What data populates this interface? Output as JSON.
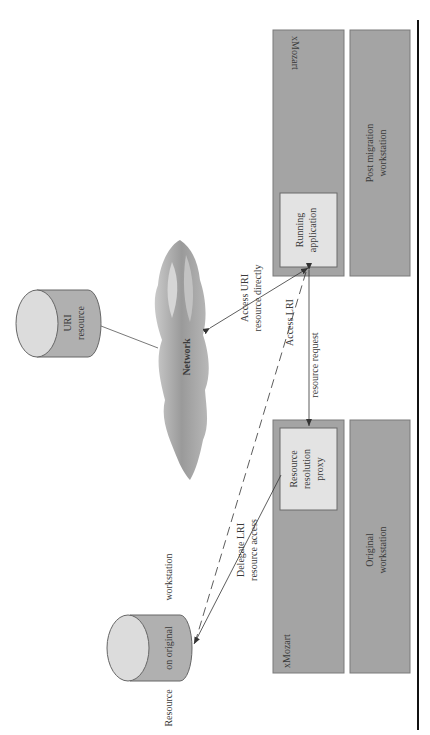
{
  "diagram": {
    "orientation": "rotated-90-counterclockwise",
    "colors": {
      "box_fill": "#a4a4a4",
      "box_stroke": "#7a7a7a",
      "inner_fill": "#e3e3e3",
      "cylinder_body": "#b0b0b0",
      "cylinder_top": "#dcdcdc",
      "cloud": "#a8a8a8",
      "line": "#444444",
      "rule": "#111111"
    },
    "nodes": {
      "top_xmozart": {
        "label": "xMozart"
      },
      "running_app": {
        "line1": "Running",
        "line2": "application"
      },
      "post_migration": {
        "line1": "Post migration",
        "line2": "workstation"
      },
      "bottom_xmozart": {
        "label": "xMozart"
      },
      "proxy": {
        "line1": "Resource",
        "line2": "resolution",
        "line3": "proxy"
      },
      "original_ws": {
        "line1": "Original",
        "line2": "workstation"
      },
      "uri_resource": {
        "line1": "URI",
        "line2": "resource"
      },
      "network": {
        "label": "Network"
      },
      "orig_resource": {
        "part1": "Resource",
        "part2": "on original",
        "part3": "workstation"
      }
    },
    "edges": {
      "access_uri": {
        "line1": "Access URI",
        "line2": "resource directly"
      },
      "access_lri": {
        "line1": "Access LRI",
        "line2": "resource request"
      },
      "delegate_lri": {
        "line1": "Delegate LRI",
        "line2": "resource access"
      }
    }
  }
}
